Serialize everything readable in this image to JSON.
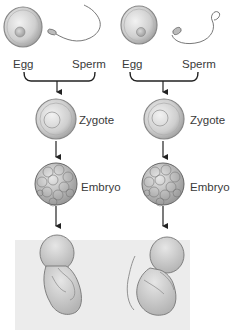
{
  "diagram": {
    "title": "",
    "columns": [
      {
        "id": "left",
        "labels": {
          "egg": "Egg",
          "sperm": "Sperm",
          "zygote": "Zygote",
          "embryo": "Embryo"
        }
      },
      {
        "id": "right",
        "labels": {
          "egg": "Egg",
          "sperm": "Sperm",
          "zygote": "Zygote",
          "embryo": "Embryo"
        }
      }
    ],
    "stages": [
      "Egg + Sperm",
      "Zygote",
      "Embryo",
      "Fetus"
    ],
    "colors": {
      "background": "#ffffff",
      "fetus_panel": "#ececec",
      "cell_fill": "#d8d8d8",
      "outline": "#555555",
      "arrow": "#222222"
    }
  }
}
